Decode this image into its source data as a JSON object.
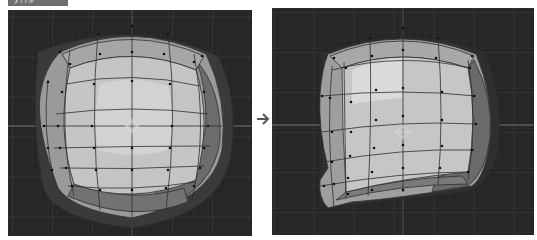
{
  "figure": {
    "label": "ﾀｲﾄﾙ",
    "arrow": "→"
  },
  "viewports": [
    {
      "name": "before",
      "description": "Subdivided cube mesh (sphere-like), front view"
    },
    {
      "name": "after",
      "description": "Same mesh with lower-left vertices pulled and left side flattened"
    }
  ],
  "colors": {
    "viewport_bg": "#262626",
    "grid_line": "#3a3a3a",
    "axis_line": "#8a8a8a",
    "face_light": "#c9c9c9",
    "face_mid": "#a9a9a9",
    "face_dark": "#6a6a6a",
    "edge": "#2e2e2e",
    "vertex": "#111111"
  }
}
